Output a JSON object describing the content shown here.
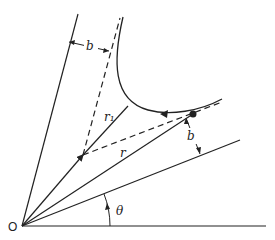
{
  "diagram": {
    "type": "geometric construction — hyperbolic trajectory (scattering) in polar coordinates",
    "labels": {
      "origin": "O",
      "angle": "θ",
      "impact_parameter_top": "b",
      "impact_parameter_right": "b",
      "radius_closest": "r₁",
      "radius": "r"
    },
    "elements": [
      "horizontal reference axis from O",
      "incoming asymptote direction line from O (left, steep)",
      "outgoing asymptote direction line from O at angle θ",
      "dashed incoming asymptote offset by b",
      "dashed outgoing asymptote offset by b",
      "curved trajectory with direction arrow",
      "particle position dot",
      "radius r from O to particle",
      "radius r1 from asymptote intersection to curve"
    ],
    "colors": {
      "ink": "#222222",
      "background": "#ffffff"
    }
  }
}
